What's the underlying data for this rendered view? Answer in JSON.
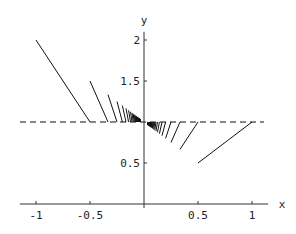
{
  "chart_data": {
    "type": "line",
    "title": "",
    "xlabel": "x",
    "ylabel": "y",
    "xlim": [
      -1.15,
      1.15
    ],
    "ylim": [
      0,
      2.1
    ],
    "x_ticks": [
      {
        "value": -1,
        "label": "-1"
      },
      {
        "value": -0.5,
        "label": "-0.5"
      },
      {
        "value": 0.5,
        "label": "0.5"
      },
      {
        "value": 1,
        "label": "1"
      }
    ],
    "y_ticks": [
      {
        "value": 0.5,
        "label": "0.5"
      },
      {
        "value": 1.5,
        "label": "1.5"
      },
      {
        "value": 2,
        "label": "2"
      }
    ],
    "reference_line": {
      "y": 1,
      "style": "dashed"
    },
    "series": [
      {
        "name": "left segments",
        "n_max": 30
      },
      {
        "name": "right segments",
        "n_max": 30
      }
    ],
    "grid": false
  },
  "colors": {
    "line": "#111111",
    "axis": "#333333"
  }
}
